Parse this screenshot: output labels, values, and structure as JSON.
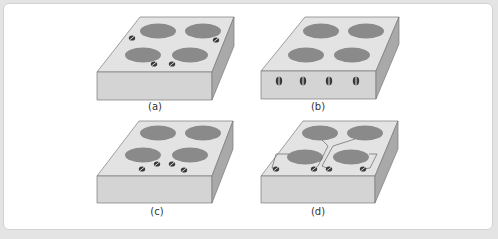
{
  "figure": {
    "panels": [
      {
        "id": "a",
        "label": "(a)",
        "description": "Cooktop with four burners; control knobs placed on top surface next to each burner"
      },
      {
        "id": "b",
        "label": "(b)",
        "description": "Cooktop with four burners; four control knobs in a row on the front face"
      },
      {
        "id": "c",
        "label": "(c)",
        "description": "Cooktop with four burners; four knobs grouped on top surface in front center"
      },
      {
        "id": "d",
        "label": "(d)",
        "description": "Cooktop with four burners; four knobs in a row on top front edge, connected to burners by lines"
      }
    ]
  },
  "colors": {
    "background": "#e4e4e4",
    "card": "#ffffff",
    "top_surface": "#e3e3e3",
    "front_face": "#d4d4d4",
    "side_face": "#a9a9a9",
    "burner": "#8a8a8a",
    "knob": "#3a3a3a",
    "outline": "#7a7a7a"
  }
}
